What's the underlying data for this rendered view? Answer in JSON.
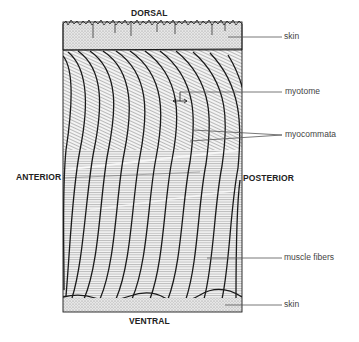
{
  "figure": {
    "orientation": {
      "top": "DORSAL",
      "bottom": "VENTRAL",
      "left": "ANTERIOR",
      "right": "POSTERIOR"
    },
    "labels": [
      {
        "id": "skin-top",
        "text": "skin"
      },
      {
        "id": "myotome",
        "text": "myotome"
      },
      {
        "id": "myocommata",
        "text": "myocommata"
      },
      {
        "id": "muscle-fibers",
        "text": "muscle fibers"
      },
      {
        "id": "skin-bottom",
        "text": "skin"
      }
    ],
    "colors": {
      "line": "#1a1a1a",
      "skin_fill": "#dcdcdc",
      "hatch": "#9a9a9a",
      "label_text": "#444444",
      "leader": "#555555"
    }
  }
}
